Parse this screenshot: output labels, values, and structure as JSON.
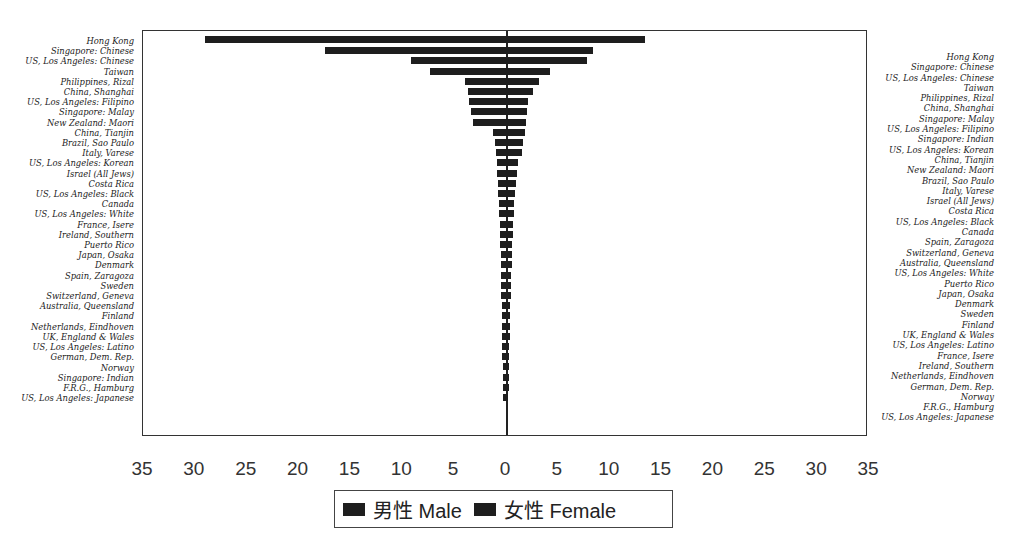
{
  "chart_data": {
    "type": "bar",
    "orientation": "horizontal-butterfly",
    "title": "",
    "xlabel": "",
    "ylabel": "",
    "xlim": [
      -35,
      35
    ],
    "x_ticks": [
      "35",
      "30",
      "25",
      "20",
      "15",
      "10",
      "5",
      "0",
      "5",
      "10",
      "15",
      "20",
      "25",
      "30",
      "35"
    ],
    "grid": false,
    "legend_position": "bottom",
    "legend": [
      {
        "label": "男性 Male",
        "color": "#1e1e1e"
      },
      {
        "label": "女性 Female",
        "color": "#1e1e1e"
      }
    ],
    "series": [
      {
        "name": "男性 Male",
        "side": "left",
        "categories": [
          "Hong Kong",
          "Singapore: Chinese",
          "US, Los Angeles: Chinese",
          "Taiwan",
          "Philippines, Rizal",
          "China, Shanghai",
          "US, Los Angeles: Filipino",
          "Singapore: Malay",
          "New Zealand: Maori",
          "China, Tianjin",
          "Brazil, Sao Paulo",
          "Italy, Varese",
          "US, Los Angeles: Korean",
          "Israel (All Jews)",
          "Costa Rica",
          "US, Los Angeles: Black",
          "Canada",
          "US, Los Angeles: White",
          "France, Isere",
          "Ireland, Southern",
          "Puerto Rico",
          "Japan, Osaka",
          "Denmark",
          "Spain, Zaragoza",
          "Sweden",
          "Switzerland, Geneva",
          "Australia, Queensland",
          "Finland",
          "Netherlands, Eindhoven",
          "UK, England & Wales",
          "US, Los Angeles: Latino",
          "German, Dem. Rep.",
          "Norway",
          "Singapore: Indian",
          "F.R.G., Hamburg",
          "US, Los Angeles: Japanese"
        ],
        "values": [
          29.0,
          17.5,
          9.2,
          7.3,
          4.0,
          3.7,
          3.6,
          3.4,
          3.2,
          1.3,
          1.1,
          1.0,
          0.9,
          0.9,
          0.8,
          0.8,
          0.7,
          0.7,
          0.6,
          0.6,
          0.6,
          0.5,
          0.5,
          0.5,
          0.5,
          0.5,
          0.4,
          0.4,
          0.4,
          0.4,
          0.4,
          0.4,
          0.3,
          0.3,
          0.3,
          0.3
        ]
      },
      {
        "name": "女性 Female",
        "side": "right",
        "categories": [
          "Hong Kong",
          "Singapore: Chinese",
          "US, Los Angeles: Chinese",
          "Taiwan",
          "Philippines, Rizal",
          "China, Shanghai",
          "Singapore: Malay",
          "US, Los Angeles: Filipino",
          "Singapore: Indian",
          "US, Los Angeles: Korean",
          "China, Tianjin",
          "New Zealand: Maori",
          "Brazil, Sao Paulo",
          "Italy, Varese",
          "Israel (All Jews)",
          "Costa Rica",
          "US, Los Angeles: Black",
          "Canada",
          "Spain, Zaragoza",
          "Switzerland, Geneva",
          "Australia, Queensland",
          "US, Los Angeles: White",
          "Puerto Rico",
          "Japan, Osaka",
          "Denmark",
          "Sweden",
          "Finland",
          "UK, England & Wales",
          "US, Los Angeles: Latino",
          "France, Isere",
          "Ireland, Southern",
          "Netherlands, Eindhoven",
          "German, Dem. Rep.",
          "Norway",
          "F.R.G., Hamburg",
          "US, Los Angeles: Japanese"
        ],
        "values": [
          13.4,
          8.4,
          7.8,
          4.2,
          3.2,
          2.6,
          2.1,
          2.0,
          1.9,
          1.8,
          1.6,
          1.5,
          1.2,
          1.1,
          1.0,
          0.9,
          0.8,
          0.8,
          0.7,
          0.7,
          0.6,
          0.6,
          0.6,
          0.5,
          0.5,
          0.5,
          0.4,
          0.4,
          0.4,
          0.4,
          0.3,
          0.3,
          0.3,
          0.3,
          0.3,
          0.2
        ]
      }
    ]
  },
  "legend": {
    "male_label": "男性 Male",
    "female_label": "女性 Female"
  }
}
